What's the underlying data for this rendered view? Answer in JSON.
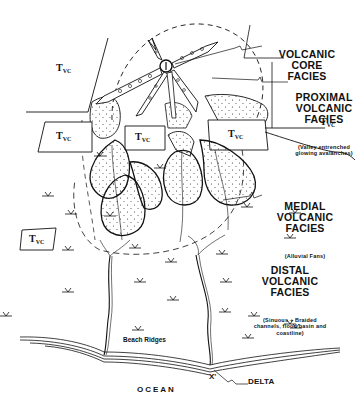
{
  "diagram": {
    "facies_labels": [
      {
        "id": "core",
        "main": "VOLCANIC CORE\nFACIES",
        "sub": ""
      },
      {
        "id": "proximal",
        "main": "PROXIMAL\nVOLCANIC\nFACIES",
        "sub": "(Valley entrenched\nglowing avalanches)"
      },
      {
        "id": "medial",
        "main": "MEDIAL\nVOLCANIC\nFACIES",
        "sub": "(Alluvial Fans)"
      },
      {
        "id": "distal",
        "main": "DISTAL\nVOLCANIC\nFACIES",
        "sub": "(Sinuous + Braided\nchannels, flood basin and\ncoastline)"
      }
    ],
    "unit_label": {
      "base": "T",
      "subscript": "VC"
    },
    "features": {
      "beach_ridges": "Beach Ridges",
      "delta": "DELTA",
      "ocean": "OCEAN",
      "x_mark": "X'"
    },
    "colors": {
      "ink": "#111111",
      "background": "#ffffff",
      "stipple": "#333333"
    }
  }
}
